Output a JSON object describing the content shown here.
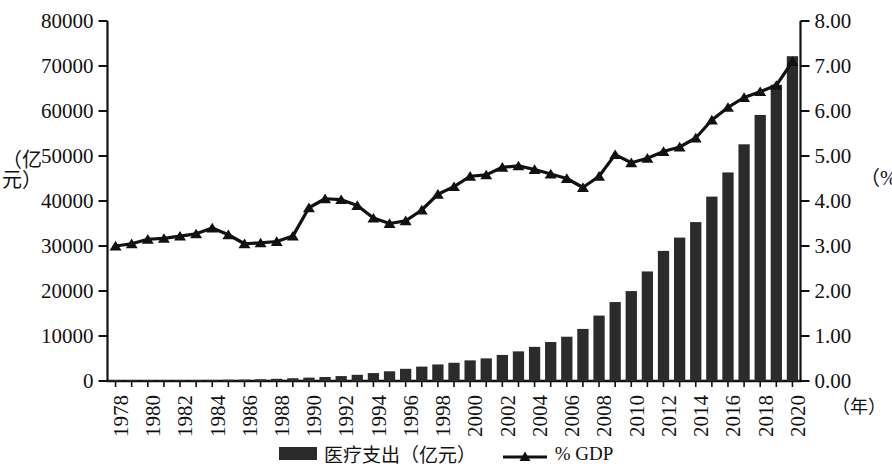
{
  "chart_data": {
    "type": "bar",
    "title": "",
    "subtitle": "",
    "xlabel": "（年）",
    "ylabel": "（亿元）",
    "ylabel_right": "（%）",
    "grid": false,
    "legend_position": "bottom-center",
    "x": [
      1978,
      1979,
      1980,
      1981,
      1982,
      1983,
      1984,
      1985,
      1986,
      1987,
      1988,
      1989,
      1990,
      1991,
      1992,
      1993,
      1994,
      1995,
      1996,
      1997,
      1998,
      1999,
      2000,
      2001,
      2002,
      2003,
      2004,
      2005,
      2006,
      2007,
      2008,
      2009,
      2010,
      2011,
      2012,
      2013,
      2014,
      2015,
      2016,
      2017,
      2018,
      2019,
      2020
    ],
    "xtick_labels": [
      "1978",
      "1980",
      "1982",
      "1984",
      "1986",
      "1988",
      "1990",
      "1992",
      "1994",
      "1996",
      "1998",
      "2000",
      "2002",
      "2004",
      "2006",
      "2008",
      "2010",
      "2012",
      "2014",
      "2016",
      "2018",
      "2020"
    ],
    "ylim": [
      0,
      80000
    ],
    "ytick_labels": [
      "0",
      "10000",
      "20000",
      "30000",
      "40000",
      "50000",
      "60000",
      "70000",
      "80000"
    ],
    "ylim_right": [
      0,
      8.0
    ],
    "ytick_labels_right": [
      "0.00",
      "1.00",
      "2.00",
      "3.00",
      "4.00",
      "5.00",
      "6.00",
      "7.00",
      "8.00"
    ],
    "series": [
      {
        "name": "医疗支出（亿元）",
        "type": "bar",
        "axis": "left",
        "color": "#2b2b2b",
        "values": [
          110,
          126,
          143,
          161,
          177,
          208,
          242,
          279,
          315,
          380,
          488,
          615,
          747,
          893,
          1096,
          1378,
          1761,
          2155,
          2709,
          3197,
          3678,
          4048,
          4586,
          5026,
          5790,
          6584,
          7590,
          8660,
          9843,
          11574,
          14535,
          17542,
          19980,
          24346,
          28914,
          31869,
          35312,
          40975,
          46345,
          52598,
          59122,
          65842,
          72175
        ]
      },
      {
        "name": "% GDP",
        "type": "line",
        "axis": "right",
        "marker": "triangle",
        "color": "#111111",
        "values": [
          3.0,
          3.05,
          3.15,
          3.17,
          3.22,
          3.27,
          3.4,
          3.25,
          3.05,
          3.07,
          3.1,
          3.22,
          3.85,
          4.05,
          4.03,
          3.9,
          3.62,
          3.5,
          3.56,
          3.8,
          4.15,
          4.32,
          4.55,
          4.58,
          4.75,
          4.78,
          4.7,
          4.6,
          4.5,
          4.3,
          4.55,
          5.03,
          4.85,
          4.95,
          5.1,
          5.2,
          5.4,
          5.8,
          6.08,
          6.3,
          6.43,
          6.57,
          7.1
        ]
      }
    ]
  },
  "legend": {
    "items": [
      {
        "label": "医疗支出（亿元）",
        "marker": "bar-swatch"
      },
      {
        "label": "% GDP",
        "marker": "line-triangle"
      }
    ]
  },
  "axes": {
    "left_title": "（亿元）",
    "right_title": "（%）",
    "x_unit": "（年）"
  }
}
